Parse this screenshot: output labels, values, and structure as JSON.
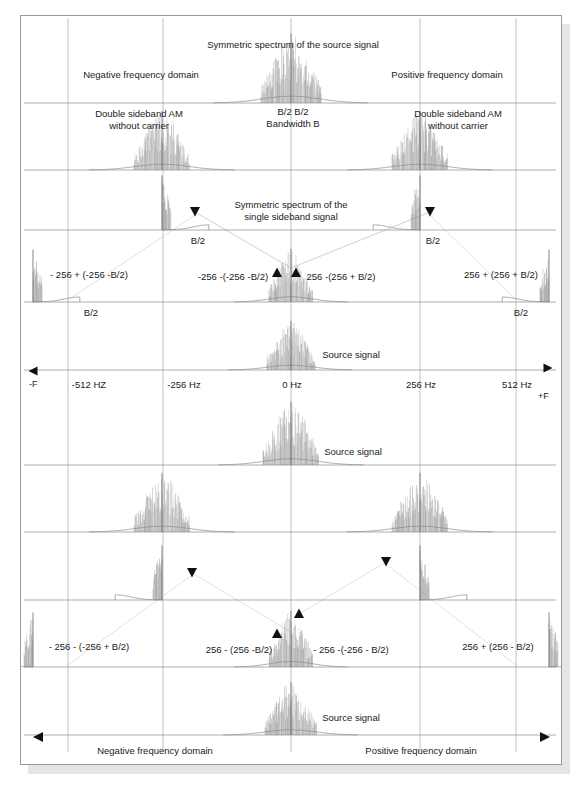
{
  "figure": {
    "type": "signal-spectrum-diagram",
    "background": "#ffffff",
    "line_color": "#8a8a8a",
    "text_color": "#1a1a1a"
  },
  "axis": {
    "ticks": [
      {
        "label": "-512 HZ",
        "value": -512,
        "x": 68
      },
      {
        "label": "-256 Hz",
        "value": -256,
        "x": 163
      },
      {
        "label": "0 Hz",
        "value": 0,
        "x": 291
      },
      {
        "label": "256 Hz",
        "value": 256,
        "x": 420
      },
      {
        "label": "512 Hz",
        "value": 512,
        "x": 516
      }
    ],
    "negative_marker": "-F",
    "positive_marker": "+F"
  },
  "labels": {
    "symmetric_source_spectrum": "Symmetric spectrum of the source signal",
    "negative_domain_top": "Negative frequency domain",
    "positive_domain_top": "Positive frequency domain",
    "dsb_left_line1": "Double sideband AM",
    "dsb_left_line2": "without carrier",
    "dsb_right_line1": "Double sideband AM",
    "dsb_right_line2": "without carrier",
    "b_halves": "B/2  B/2",
    "bandwidth": "Bandwidth B",
    "ssb_line1": "Symmetric spectrum of the",
    "ssb_line2": "single sideband signal",
    "b2_left_upper": "B/2",
    "b2_right_upper": "B/2",
    "b2_left_lower": "B/2",
    "b2_right_lower": "B/2",
    "source_signal_mid": "Source signal",
    "source_signal_lower1": "Source signal",
    "source_signal_lower2": "Source signal",
    "negative_domain_bottom": "Negative frequency domain",
    "positive_domain_bottom": "Positive frequency domain"
  },
  "equations": {
    "upper": [
      {
        "text": "- 256 + (-256 -B/2)",
        "x": 88,
        "y": 268
      },
      {
        "text": "-256 -(-256 -B/2)",
        "x": 232,
        "y": 270
      },
      {
        "text": "256 -(256 + B/2)",
        "x": 340,
        "y": 270
      },
      {
        "text": "256 + (256 + B/2)",
        "x": 500,
        "y": 268
      }
    ],
    "lower": [
      {
        "text": "- 256 - (-256 + B/2)",
        "x": 88,
        "y": 640
      },
      {
        "text": "256 - (256 -B/2)",
        "x": 238,
        "y": 643
      },
      {
        "text": "- 256 -(-256 - B/2)",
        "x": 350,
        "y": 643
      },
      {
        "text": "256 + (256 - B/2)",
        "x": 497,
        "y": 640
      }
    ]
  },
  "chart_data": {
    "type": "line",
    "title": "Symmetric spectrum of the source signal",
    "xlabel": "Frequency",
    "ylabel": "",
    "xlim": [
      -620,
      620
    ],
    "xticks": [
      -512,
      -256,
      0,
      256,
      512
    ],
    "xticklabels": [
      "-512 HZ",
      "-256 Hz",
      "0 Hz",
      "256 Hz",
      "512 Hz"
    ],
    "grid": true,
    "legend": "none",
    "traces": [
      {
        "name": "source-spectrum-row-1",
        "baseline_y": 103,
        "peaks": [
          {
            "center": 0,
            "width": 30,
            "height": 68,
            "type": "noisy-band"
          }
        ]
      },
      {
        "name": "dsb-am-row-2",
        "baseline_y": 170,
        "peaks": [
          {
            "center": -256,
            "width": 28,
            "height": 58,
            "type": "noisy-band"
          },
          {
            "center": 256,
            "width": 28,
            "height": 58,
            "type": "noisy-band"
          }
        ]
      },
      {
        "name": "ssb-row-3",
        "baseline_y": 230,
        "peaks": [
          {
            "center": -256,
            "width": 9,
            "height": 52,
            "type": "narrow-edge",
            "side": "right"
          },
          {
            "center": 256,
            "width": 9,
            "height": 52,
            "type": "narrow-edge",
            "side": "left"
          }
        ]
      },
      {
        "name": "demodulated-row-4",
        "baseline_y": 302,
        "peaks": [
          {
            "center": -512,
            "width": 9,
            "height": 50,
            "type": "narrow-edge",
            "side": "right"
          },
          {
            "center": 0,
            "width": 22,
            "height": 52,
            "type": "noisy-band"
          },
          {
            "center": 512,
            "width": 9,
            "height": 50,
            "type": "narrow-edge",
            "side": "left"
          }
        ]
      },
      {
        "name": "source-signal-row-5",
        "baseline_y": 370,
        "peaks": [
          {
            "center": 0,
            "width": 24,
            "height": 48,
            "type": "noisy-band"
          }
        ]
      },
      {
        "name": "source-signal-row-6",
        "baseline_y": 465,
        "peaks": [
          {
            "center": 0,
            "width": 28,
            "height": 62,
            "type": "noisy-band"
          }
        ]
      },
      {
        "name": "dsb-am-row-7",
        "baseline_y": 532,
        "peaks": [
          {
            "center": -256,
            "width": 28,
            "height": 58,
            "type": "noisy-band"
          },
          {
            "center": 256,
            "width": 28,
            "height": 58,
            "type": "noisy-band"
          }
        ]
      },
      {
        "name": "ssb-row-8",
        "baseline_y": 600,
        "peaks": [
          {
            "center": -256,
            "width": 9,
            "height": 52,
            "type": "narrow-edge",
            "side": "left"
          },
          {
            "center": 256,
            "width": 9,
            "height": 52,
            "type": "narrow-edge",
            "side": "right"
          }
        ]
      },
      {
        "name": "demodulated-row-9",
        "baseline_y": 667,
        "peaks": [
          {
            "center": -512,
            "width": 9,
            "height": 52,
            "type": "narrow-edge",
            "side": "left"
          },
          {
            "center": 0,
            "width": 22,
            "height": 55,
            "type": "noisy-band"
          },
          {
            "center": 512,
            "width": 9,
            "height": 52,
            "type": "narrow-edge",
            "side": "right"
          }
        ]
      },
      {
        "name": "source-signal-row-10",
        "baseline_y": 735,
        "peaks": [
          {
            "center": 0,
            "width": 26,
            "height": 52,
            "type": "noisy-band"
          }
        ]
      }
    ],
    "markers": [
      {
        "shape": "triangle-down",
        "x": 195,
        "y": 212
      },
      {
        "shape": "triangle-down",
        "x": 430,
        "y": 212
      },
      {
        "shape": "triangle-up",
        "x": 277,
        "y": 272
      },
      {
        "shape": "triangle-up",
        "x": 296,
        "y": 272
      },
      {
        "shape": "triangle-down",
        "x": 192,
        "y": 573
      },
      {
        "shape": "triangle-down",
        "x": 386,
        "y": 562
      },
      {
        "shape": "triangle-up",
        "x": 277,
        "y": 633
      },
      {
        "shape": "triangle-up",
        "x": 299,
        "y": 613
      }
    ]
  }
}
